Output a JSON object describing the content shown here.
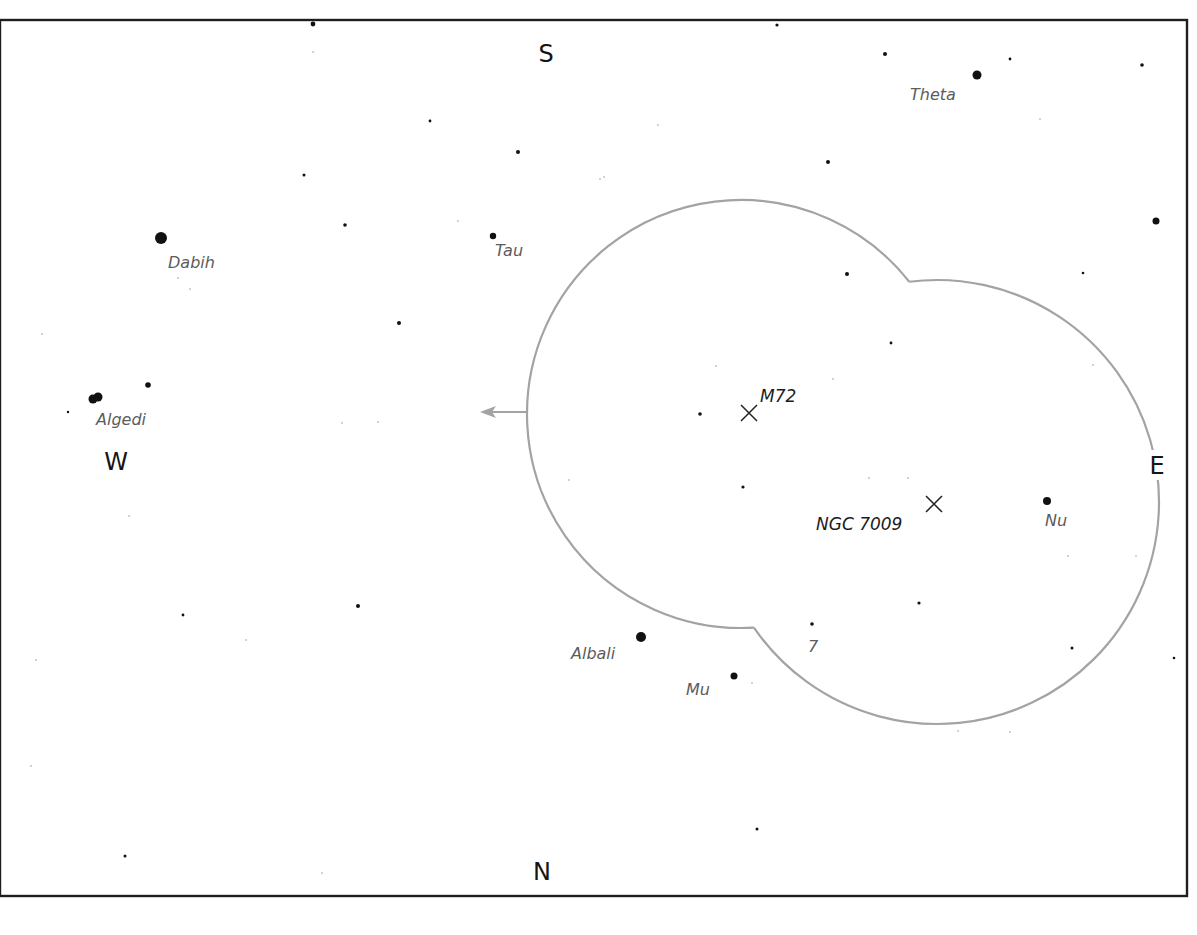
{
  "chart": {
    "frame": {
      "left": 0,
      "top": 20,
      "right": 1187,
      "bottom": 896
    },
    "cardinals": [
      {
        "id": "south",
        "label": "S",
        "x": 546,
        "y": 62
      },
      {
        "id": "west",
        "label": "W",
        "x": 116,
        "y": 470
      },
      {
        "id": "east",
        "label": "E",
        "x": 1157,
        "y": 474
      },
      {
        "id": "north",
        "label": "N",
        "x": 542,
        "y": 880
      }
    ],
    "field_of_view": {
      "circles": [
        {
          "cx": 741,
          "cy": 414,
          "r": 214
        },
        {
          "cx": 937,
          "cy": 502,
          "r": 222
        }
      ],
      "arrow": {
        "x1": 528,
        "y1": 412,
        "x2": 480,
        "y2": 412
      },
      "color": "#a3a3a3"
    },
    "deep_sky_objects": [
      {
        "id": "m72",
        "label": "M72",
        "x": 749,
        "y": 413,
        "lx": 760,
        "ly": 402
      },
      {
        "id": "ngc7009",
        "label": "NGC 7009",
        "x": 934,
        "y": 504,
        "lx": 816,
        "ly": 530
      }
    ],
    "named_stars": [
      {
        "id": "theta",
        "label": "Theta",
        "x": 977,
        "y": 75,
        "r": 4.5,
        "lx": 910,
        "ly": 100
      },
      {
        "id": "dabih",
        "label": "Dabih",
        "x": 161,
        "y": 238,
        "r": 6,
        "lx": 168,
        "ly": 268
      },
      {
        "id": "tau",
        "label": "Tau",
        "x": 493,
        "y": 236,
        "r": 3.2,
        "lx": 495,
        "ly": 256
      },
      {
        "id": "algedi",
        "label": "Algedi",
        "x": 93,
        "y": 399,
        "r": 4.5,
        "lx": 96,
        "ly": 425
      },
      {
        "id": "nu",
        "label": "Nu",
        "x": 1047,
        "y": 501,
        "r": 4,
        "lx": 1045,
        "ly": 526
      },
      {
        "id": "albali",
        "label": "Albali",
        "x": 641,
        "y": 637,
        "r": 5,
        "lx": 571,
        "ly": 659
      },
      {
        "id": "mu",
        "label": "Mu",
        "x": 734,
        "y": 676,
        "r": 3.5,
        "lx": 686,
        "ly": 695
      },
      {
        "id": "seven",
        "label": "7",
        "x": 812,
        "y": 624,
        "r": 1.8,
        "lx": 808,
        "ly": 652
      }
    ],
    "stars": [
      {
        "x": 313,
        "y": 24,
        "r": 2.4
      },
      {
        "x": 777,
        "y": 25,
        "r": 1.6
      },
      {
        "x": 885,
        "y": 54,
        "r": 2
      },
      {
        "x": 1010,
        "y": 59,
        "r": 1.4
      },
      {
        "x": 1142,
        "y": 65,
        "r": 1.8
      },
      {
        "x": 430,
        "y": 121,
        "r": 1.4
      },
      {
        "x": 518,
        "y": 152,
        "r": 2
      },
      {
        "x": 828,
        "y": 162,
        "r": 2
      },
      {
        "x": 304,
        "y": 175,
        "r": 1.5
      },
      {
        "x": 345,
        "y": 225,
        "r": 1.8
      },
      {
        "x": 1156,
        "y": 221,
        "r": 3.5
      },
      {
        "x": 847,
        "y": 274,
        "r": 2
      },
      {
        "x": 1083,
        "y": 273,
        "r": 1.3
      },
      {
        "x": 399,
        "y": 323,
        "r": 2
      },
      {
        "x": 891,
        "y": 343,
        "r": 1.4
      },
      {
        "x": 148,
        "y": 385,
        "r": 2.8
      },
      {
        "x": 98,
        "y": 397,
        "r": 4.5
      },
      {
        "x": 68,
        "y": 412,
        "r": 1.2
      },
      {
        "x": 700,
        "y": 414,
        "r": 1.8
      },
      {
        "x": 743,
        "y": 487,
        "r": 1.6
      },
      {
        "x": 919,
        "y": 603,
        "r": 1.6
      },
      {
        "x": 358,
        "y": 606,
        "r": 2
      },
      {
        "x": 183,
        "y": 615,
        "r": 1.4
      },
      {
        "x": 1072,
        "y": 648,
        "r": 1.5
      },
      {
        "x": 1174,
        "y": 658,
        "r": 1.3
      },
      {
        "x": 757,
        "y": 829,
        "r": 1.5
      },
      {
        "x": 125,
        "y": 856,
        "r": 1.5
      }
    ],
    "faint_stars": [
      {
        "x": 313,
        "y": 52
      },
      {
        "x": 658,
        "y": 125
      },
      {
        "x": 604,
        "y": 177
      },
      {
        "x": 1040,
        "y": 119
      },
      {
        "x": 600,
        "y": 179
      },
      {
        "x": 178,
        "y": 278
      },
      {
        "x": 190,
        "y": 289
      },
      {
        "x": 458,
        "y": 221
      },
      {
        "x": 42,
        "y": 334
      },
      {
        "x": 716,
        "y": 366
      },
      {
        "x": 833,
        "y": 379
      },
      {
        "x": 342,
        "y": 423
      },
      {
        "x": 378,
        "y": 422
      },
      {
        "x": 1093,
        "y": 365
      },
      {
        "x": 129,
        "y": 516
      },
      {
        "x": 569,
        "y": 480
      },
      {
        "x": 869,
        "y": 478
      },
      {
        "x": 908,
        "y": 478
      },
      {
        "x": 1068,
        "y": 556
      },
      {
        "x": 1136,
        "y": 556
      },
      {
        "x": 246,
        "y": 640
      },
      {
        "x": 36,
        "y": 660
      },
      {
        "x": 752,
        "y": 683
      },
      {
        "x": 958,
        "y": 731
      },
      {
        "x": 1010,
        "y": 732
      },
      {
        "x": 31,
        "y": 766
      },
      {
        "x": 322,
        "y": 873
      }
    ]
  }
}
